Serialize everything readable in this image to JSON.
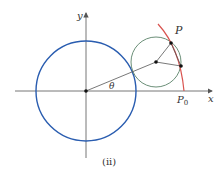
{
  "diagram": {
    "caption": "(ii)",
    "axes": {
      "x_label": "x",
      "y_label": "y",
      "origin": [
        86,
        91
      ],
      "color": "#666666"
    },
    "large_circle": {
      "center": [
        86,
        91
      ],
      "radius": 50,
      "color": "#2a5db0"
    },
    "small_circle": {
      "center": [
        156,
        62
      ],
      "radius": 25,
      "color": "#5c8a6e"
    },
    "epicycloid_arc": {
      "color": "#d9534f"
    },
    "points": {
      "P": {
        "label": "P",
        "pos": [
          171,
          43
        ]
      },
      "P0": {
        "label": "P",
        "subscript": "0",
        "pos": [
          184,
          91
        ]
      },
      "contact": {
        "pos": [
          181,
          66
        ]
      },
      "small_center": {
        "pos": [
          156,
          62
        ]
      }
    },
    "angle_label": "θ"
  }
}
